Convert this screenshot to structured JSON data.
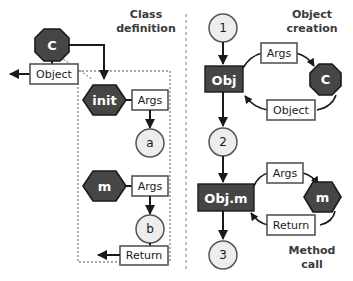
{
  "diagram": {
    "title_left_line1": "Class",
    "title_left_line2": "definition",
    "title_right_top_line1": "Object",
    "title_right_top_line2": "creation",
    "title_right_bottom_line1": "Method",
    "title_right_bottom_line2": "call",
    "colors": {
      "dark_fill": "#464646",
      "light_fill": "#ededed",
      "white_fill": "#ffffff",
      "stroke": "#333333",
      "text_dark": "#1a1a1a",
      "text_light": "#ffffff",
      "title_text": "#3a3a3a",
      "divider": "#bdbdbd"
    },
    "left_panel": {
      "class_node": "C",
      "object_box": "Object",
      "init_node": "init",
      "init_args_box": "Args",
      "init_result_node": "a",
      "method_node": "m",
      "method_args_box": "Args",
      "method_result_node": "b",
      "return_box": "Return"
    },
    "right_panel": {
      "step1": "1",
      "step2": "2",
      "step3": "3",
      "obj_box": "Obj",
      "objm_box": "Obj.m",
      "class_node": "C",
      "method_node": "m",
      "creation_args_box": "Args",
      "creation_object_box": "Object",
      "call_args_box": "Args",
      "call_return_box": "Return"
    }
  }
}
